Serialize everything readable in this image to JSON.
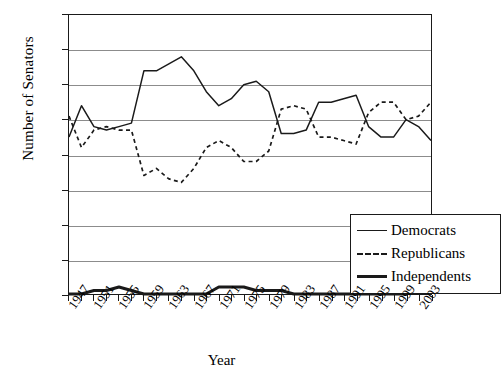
{
  "chart_data": {
    "type": "line",
    "title": "",
    "xlabel": "Year",
    "ylabel": "Number of Senators",
    "xlim": [
      1947,
      2005
    ],
    "ylim": [
      0,
      80
    ],
    "yticks": [
      0,
      10,
      20,
      30,
      40,
      50,
      60,
      70,
      80
    ],
    "grid": true,
    "legend_position": "inside-bottom-right",
    "x": [
      1947,
      1949,
      1951,
      1953,
      1955,
      1957,
      1959,
      1961,
      1963,
      1965,
      1967,
      1969,
      1971,
      1973,
      1975,
      1977,
      1979,
      1981,
      1983,
      1985,
      1987,
      1989,
      1991,
      1993,
      1995,
      1997,
      1999,
      2001,
      2003,
      2005
    ],
    "tick_labels": [
      "1947",
      "1951",
      "1955",
      "1959",
      "1963",
      "1967",
      "1971",
      "1975",
      "1979",
      "1983",
      "1987",
      "1991",
      "1995",
      "1999",
      "2003"
    ],
    "tick_label_years": [
      1947,
      1951,
      1955,
      1959,
      1963,
      1967,
      1971,
      1975,
      1979,
      1983,
      1987,
      1991,
      1995,
      1999,
      2003
    ],
    "series": [
      {
        "name": "Democrats",
        "style": "solid-thin",
        "values": [
          45,
          54,
          48,
          47,
          48,
          49,
          64,
          64,
          66,
          68,
          64,
          58,
          54,
          56,
          60,
          61,
          58,
          46,
          46,
          47,
          55,
          55,
          56,
          57,
          48,
          45,
          45,
          50,
          48,
          44
        ]
      },
      {
        "name": "Republicans",
        "style": "dotted",
        "values": [
          51,
          42,
          47,
          48,
          47,
          47,
          34,
          36,
          33,
          32,
          36,
          42,
          44,
          42,
          38,
          38,
          41,
          53,
          54,
          53,
          45,
          45,
          44,
          43,
          52,
          55,
          55,
          50,
          51,
          55
        ]
      },
      {
        "name": "Independents",
        "style": "solid-thick",
        "values": [
          0,
          0,
          1,
          1,
          2,
          1,
          0,
          0,
          0,
          0,
          0,
          0,
          2,
          2,
          2,
          1,
          1,
          1,
          0,
          0,
          0,
          0,
          0,
          0,
          0,
          0,
          0,
          0,
          1,
          1
        ]
      }
    ],
    "colors": {
      "line": "#1a1a1a",
      "grid": "#8c8c8c",
      "axis": "#1a1a1a",
      "background": "#ffffff"
    }
  },
  "legend": {
    "items": [
      {
        "label": "Democrats",
        "swatch": "solid-thin"
      },
      {
        "label": "Republicans",
        "swatch": "dotted"
      },
      {
        "label": "Independents",
        "swatch": "solid-thick"
      }
    ]
  }
}
